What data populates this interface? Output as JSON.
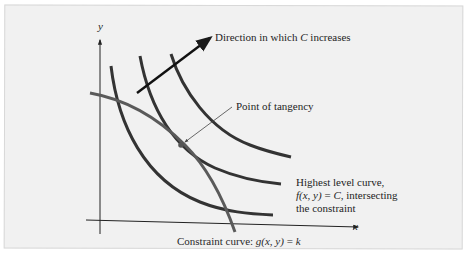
{
  "figure": {
    "type": "lagrange-multiplier-level-curves",
    "background_color": "#f1f1f1",
    "curve_color": "#333333",
    "constraint_color": "#5a5a5a",
    "axes": {
      "x_label": "x",
      "y_label": "y"
    },
    "annotations": {
      "direction_prefix": "Direction in which ",
      "direction_var": "C",
      "direction_suffix": " increases",
      "tangency": "Point of tangency",
      "highest_line1": "Highest level curve,",
      "highest_line2_func": "f(x, y)",
      "highest_line2_eq": " = ",
      "highest_line2_var": "C",
      "highest_line2_rest": ", intersecting",
      "highest_line3": "the constraint",
      "constraint_prefix": "Constraint curve: ",
      "constraint_func": "g(x, y)",
      "constraint_eq": " = ",
      "constraint_var": "k"
    },
    "level_curves": [
      {
        "name": "level-curve-1"
      },
      {
        "name": "level-curve-2-highest"
      },
      {
        "name": "level-curve-3"
      }
    ],
    "constraint_curve": {
      "name": "constraint-curve"
    }
  }
}
